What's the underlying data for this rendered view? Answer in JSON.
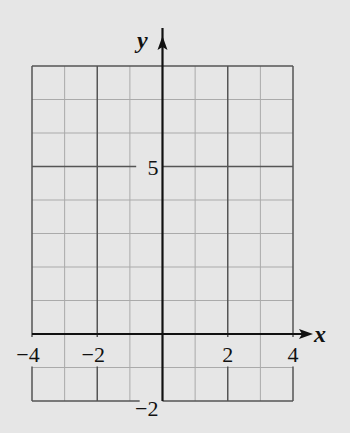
{
  "chart_data": {
    "type": "line",
    "title": "",
    "xlabel": "x",
    "ylabel": "y",
    "xlim": [
      -4,
      4
    ],
    "ylim": [
      -2,
      8
    ],
    "x_ticks": [
      -4,
      -2,
      2,
      4
    ],
    "x_tick_labels": [
      "−4",
      "−2",
      "2",
      "4"
    ],
    "y_ticks": [
      5,
      -2
    ],
    "y_tick_labels": [
      "5",
      "−2"
    ],
    "grid": true,
    "grid_minor_step": 1,
    "grid_major_x_step": 2,
    "series": []
  },
  "colors": {
    "background": "#e6e6e6",
    "minor_grid": "#aaaaaa",
    "major_grid": "#555555",
    "axis": "#111111"
  }
}
